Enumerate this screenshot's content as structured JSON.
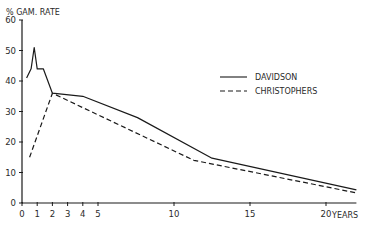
{
  "chart_data": {
    "type": "line",
    "title": "",
    "ylabel": "% GAM. RATE",
    "xlabel": "YEARS",
    "xlim": [
      0,
      22
    ],
    "ylim": [
      0,
      60
    ],
    "x_ticks": [
      0,
      1,
      2,
      3,
      4,
      5,
      10,
      15,
      20
    ],
    "y_ticks": [
      0,
      10,
      20,
      30,
      40,
      50,
      60
    ],
    "grid": false,
    "legend_position": "upper right",
    "series": [
      {
        "name": "DAVIDSON",
        "style": "solid",
        "x": [
          0.3,
          0.6,
          0.8,
          1.0,
          1.4,
          2.0,
          4.0,
          7.6,
          12.5,
          22
        ],
        "y": [
          41,
          44,
          51,
          44,
          44,
          36,
          35,
          28,
          14.7,
          4.3
        ]
      },
      {
        "name": "CHRISTOPHERS",
        "style": "dashed",
        "x": [
          0.5,
          2.0,
          11.3,
          22
        ],
        "y": [
          15,
          36,
          14,
          3.3
        ]
      }
    ]
  },
  "legend": {
    "items": [
      {
        "label": "DAVIDSON"
      },
      {
        "label": "CHRISTOPHERS"
      }
    ]
  },
  "axes": {
    "y_title": "% GAM. RATE",
    "x_title": "YEARS",
    "x_tick_labels": [
      "0",
      "1",
      "2",
      "3",
      "4",
      "5",
      "10",
      "15",
      "20"
    ],
    "y_tick_labels": [
      "0",
      "10",
      "20",
      "30",
      "40",
      "50",
      "60"
    ]
  },
  "colors": {
    "ink": "#1a1a1a"
  }
}
